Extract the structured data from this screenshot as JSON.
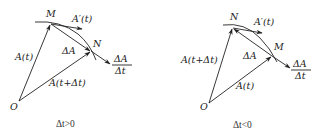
{
  "diagrams": [
    {
      "id": "positive",
      "caption": "Δt>0",
      "points": {
        "origin": "O",
        "first": "M",
        "second": "N"
      },
      "labels": {
        "vec_start": "A(t)",
        "vec_end": "A(t+Δt)",
        "delta": "ΔA",
        "derivative": "A′(t)",
        "quotient_num": "ΔA",
        "quotient_den": "Δt"
      }
    },
    {
      "id": "negative",
      "caption": "Δt<0",
      "points": {
        "origin": "O",
        "first": "N",
        "second": "M"
      },
      "labels": {
        "vec_start": "A(t+Δt)",
        "vec_end": "A(t)",
        "delta": "ΔA",
        "derivative": "A′(t)",
        "quotient_num": "ΔA",
        "quotient_den": "Δt"
      }
    }
  ],
  "colors": {
    "stroke": "#222222",
    "background": "#ffffff"
  }
}
